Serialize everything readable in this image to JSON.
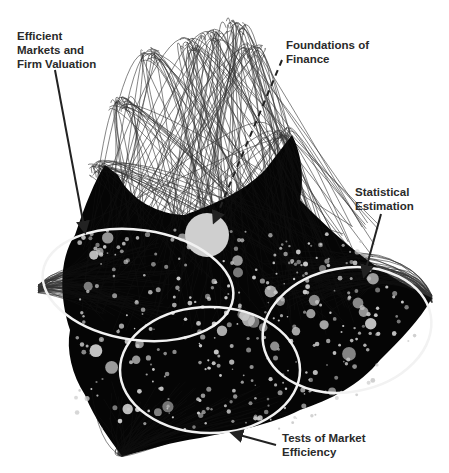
{
  "diagram": {
    "type": "network-cluster-map",
    "background": "#ffffff",
    "network_color": "#000000",
    "node_color": "#c8c8c8",
    "cluster_outline_color": "#f2f2f2",
    "label_color": "#2a2a2a",
    "hub_node": {
      "name": "Foundations of Finance hub",
      "cx": 207,
      "cy": 235,
      "r": 22
    },
    "clusters": [
      {
        "id": "efficient-markets",
        "label": "Efficient\nMarkets and\nFirm Valuation",
        "ellipse": {
          "cx": 138,
          "cy": 285,
          "rx": 96,
          "ry": 55,
          "rotate": 8
        }
      },
      {
        "id": "statistical-estimation",
        "label": "Statistical\nEstimation",
        "ellipse": {
          "cx": 347,
          "cy": 330,
          "rx": 85,
          "ry": 62,
          "rotate": -10
        }
      },
      {
        "id": "tests-of-market-efficiency",
        "label": "Tests of Market\nEfficiency",
        "ellipse": {
          "cx": 210,
          "cy": 370,
          "rx": 90,
          "ry": 63,
          "rotate": 0
        }
      }
    ]
  },
  "annotations": [
    {
      "id": "label-efficient-markets",
      "text": "Efficient\nMarkets and\nFirm Valuation",
      "x": 17,
      "y": 29,
      "arrow": {
        "x1": 55,
        "y1": 70,
        "x2": 85,
        "y2": 232,
        "style": "solid"
      }
    },
    {
      "id": "label-foundations",
      "text": "Foundations of\nFinance",
      "x": 286,
      "y": 38,
      "arrow": {
        "x1": 282,
        "y1": 60,
        "x2": 214,
        "y2": 222,
        "style": "dashed"
      }
    },
    {
      "id": "label-statistical",
      "text": "Statistical\nEstimation",
      "x": 355,
      "y": 185,
      "arrow": {
        "x1": 381,
        "y1": 214,
        "x2": 364,
        "y2": 276,
        "style": "solid"
      }
    },
    {
      "id": "label-tests",
      "text": "Tests of Market\nEfficiency",
      "x": 282,
      "y": 431,
      "arrow": {
        "x1": 276,
        "y1": 445,
        "x2": 232,
        "y2": 433,
        "style": "solid"
      }
    }
  ]
}
